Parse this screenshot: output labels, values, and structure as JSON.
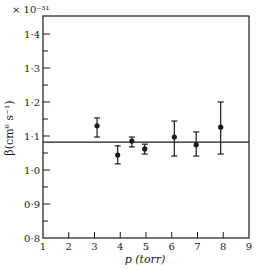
{
  "chart_data": {
    "type": "scatter",
    "title": "",
    "xlabel": "p (torr)",
    "ylabel": "β(cm⁶ s⁻¹)",
    "y_multiplier": "× 10⁻³¹",
    "xlim": [
      1,
      9
    ],
    "ylim": [
      0.8,
      1.45
    ],
    "x_ticks": [
      1,
      2,
      3,
      4,
      5,
      6,
      7,
      8,
      9
    ],
    "x_tick_labels": [
      "1",
      "2",
      "3",
      "4",
      "5",
      "6",
      "7",
      "8",
      "9"
    ],
    "y_ticks": [
      0.8,
      0.9,
      1.0,
      1.1,
      1.2,
      1.3,
      1.4
    ],
    "y_tick_labels": [
      "0·8",
      "0·9",
      "1·0",
      "1·1",
      "1·2",
      "1·3",
      "1·4"
    ],
    "y_minor_ticks": [
      0.85,
      0.95,
      1.05,
      1.15,
      1.25,
      1.35
    ],
    "grid": false,
    "legend": null,
    "series": [
      {
        "name": "β measurements",
        "marker": "filled-circle",
        "error_bars": true,
        "points": [
          {
            "x": 3.1,
            "y": 1.13,
            "err_low": 1.097,
            "err_high": 1.153
          },
          {
            "x": 3.9,
            "y": 1.044,
            "err_low": 1.018,
            "err_high": 1.071
          },
          {
            "x": 4.45,
            "y": 1.085,
            "err_low": 1.068,
            "err_high": 1.097
          },
          {
            "x": 4.95,
            "y": 1.062,
            "err_low": 1.047,
            "err_high": 1.076
          },
          {
            "x": 6.1,
            "y": 1.097,
            "err_low": 1.041,
            "err_high": 1.144
          },
          {
            "x": 6.95,
            "y": 1.074,
            "err_low": 1.041,
            "err_high": 1.112
          },
          {
            "x": 7.9,
            "y": 1.126,
            "err_low": 1.047,
            "err_high": 1.2
          }
        ]
      }
    ],
    "reference_line": {
      "type": "horizontal",
      "y": 1.082,
      "label": "mean"
    }
  },
  "colors": {
    "ink": "#1a1a1a",
    "background": "#ffffff"
  }
}
